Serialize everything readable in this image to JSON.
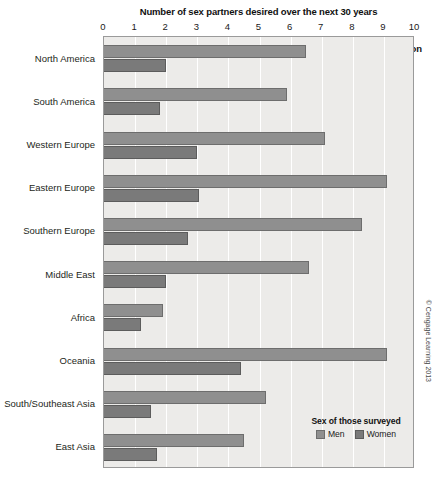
{
  "chart_data": {
    "type": "bar",
    "orientation": "horizontal",
    "title": "Number of sex partners desired over the next 30 years",
    "xlabel": "",
    "ylabel": "World region",
    "xlim": [
      0,
      10
    ],
    "xticks": [
      0,
      1,
      2,
      3,
      4,
      5,
      6,
      7,
      8,
      9,
      10
    ],
    "xtick_labels": [
      "0",
      "1",
      "2",
      "3",
      "4",
      "5",
      "6",
      "7",
      "8",
      "9",
      "10"
    ],
    "grid": "vertical",
    "legend_title": "Sex of those surveyed",
    "legend_position": "bottom-right inside plot",
    "categories": [
      "North America",
      "South America",
      "Western Europe",
      "Eastern Europe",
      "Southern Europe",
      "Middle East",
      "Africa",
      "Oceania",
      "South/Southeast Asia",
      "East Asia"
    ],
    "series": [
      {
        "name": "Men",
        "color": "#8f8f8f",
        "values": [
          6.5,
          5.9,
          7.1,
          9.1,
          8.3,
          6.6,
          1.9,
          9.1,
          5.2,
          4.5
        ]
      },
      {
        "name": "Women",
        "color": "#7a7a7a",
        "values": [
          2.0,
          1.8,
          3.0,
          3.05,
          2.7,
          2.0,
          1.2,
          4.4,
          1.5,
          1.7
        ]
      }
    ],
    "annotations": [
      "© Cengage Learning 2013"
    ]
  },
  "axis": {
    "y_heading": "World region"
  },
  "legend": {
    "title": "Sex of those surveyed",
    "items": [
      {
        "label": "Men",
        "swatch": "men"
      },
      {
        "label": "Women",
        "swatch": "women"
      }
    ]
  },
  "credit": {
    "text": "© Cengage Learning 2013"
  },
  "colors": {
    "men_bar": "#8f8f8f",
    "women_bar": "#7a7a7a",
    "plot_background": "#ecebe9",
    "gridline": "#ffffff",
    "plot_border": "#9a9a9a"
  }
}
